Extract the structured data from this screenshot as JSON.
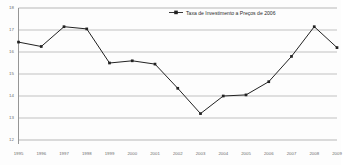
{
  "chart_data": {
    "type": "line",
    "title": "",
    "subtitle": "",
    "xlabel": "",
    "ylabel": "",
    "grid": true,
    "legend_position": "top-right",
    "categories": [
      "1995",
      "1996",
      "1997",
      "1998",
      "1999",
      "2000",
      "2001",
      "2002",
      "2003",
      "2004",
      "2005",
      "2006",
      "2007",
      "2008",
      "2009"
    ],
    "x": [
      1995,
      1996,
      1997,
      1998,
      1999,
      2000,
      2001,
      2002,
      2003,
      2004,
      2005,
      2006,
      2007,
      2008,
      2009
    ],
    "ylim": [
      12,
      18
    ],
    "yticks": [
      12,
      13,
      14,
      15,
      16,
      17,
      18
    ],
    "ytick_labels": [
      "12",
      "13",
      "14",
      "15",
      "16",
      "17",
      "18"
    ],
    "series": [
      {
        "name": "Taxa de Investimento a Preços de 2006",
        "color": "#222222",
        "marker": "square",
        "values": [
          16.45,
          16.25,
          17.15,
          17.05,
          15.5,
          15.6,
          15.45,
          14.35,
          13.2,
          14.0,
          14.05,
          14.65,
          15.8,
          17.15,
          16.2
        ]
      }
    ]
  },
  "legend": {
    "entries": [
      {
        "label": "Taxa de Investimento a Preços de 2006",
        "color": "#222222"
      }
    ]
  },
  "axes": {
    "y_tick_labels": [
      "18",
      "17",
      "16",
      "15",
      "14",
      "13",
      "12"
    ],
    "x_tick_labels": [
      "1995",
      "1996",
      "1997",
      "1998",
      "1999",
      "2000",
      "2001",
      "2002",
      "2003",
      "2004",
      "2005",
      "2006",
      "2007",
      "2008",
      "2009"
    ]
  },
  "colors": {
    "line": "#222222",
    "grid": "#9a9a9a",
    "axis": "#8a8a8a",
    "background": "#fdfdfd",
    "tick_text": "#6b6b6b"
  }
}
